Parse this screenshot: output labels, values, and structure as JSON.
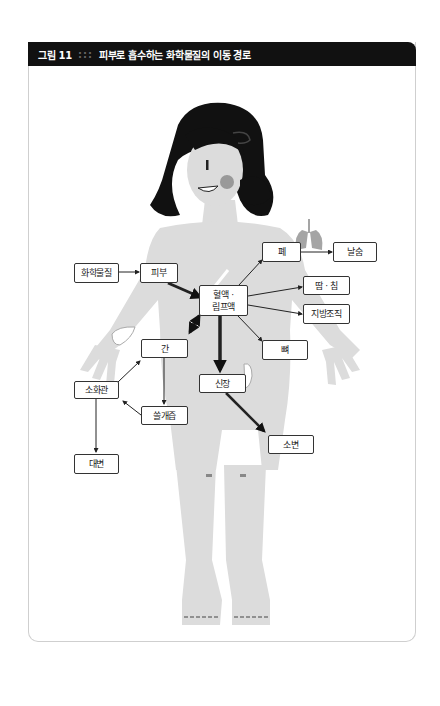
{
  "figure": {
    "number": "그림 11",
    "separator": ":::",
    "title": "피부로 흡수하는 화학물질의 이동 경로"
  },
  "nodes": {
    "chemical": "화학물질",
    "skin": "피부",
    "blood_lymph_1": "혈액 ·",
    "blood_lymph_2": "림프액",
    "lung": "폐",
    "exhale": "날숨",
    "sweat_saliva": "땀 · 침",
    "fat_tissue": "지방조직",
    "bone": "뼈",
    "liver": "간",
    "digestive_tract": "소화관",
    "bile": "쓸개즙",
    "feces": "대변",
    "kidney": "신장",
    "urine": "소변"
  },
  "edges": [
    {
      "from": "화학물질",
      "to": "피부",
      "style": "thin"
    },
    {
      "from": "피부",
      "to": "혈액 · 림프액",
      "style": "thick"
    },
    {
      "from": "혈액 · 림프액",
      "to": "폐",
      "style": "thin"
    },
    {
      "from": "폐",
      "to": "날숨",
      "style": "thin"
    },
    {
      "from": "혈액 · 림프액",
      "to": "땀 · 침",
      "style": "thin"
    },
    {
      "from": "혈액 · 림프액",
      "to": "지방조직",
      "style": "thin"
    },
    {
      "from": "혈액 · 림프액",
      "to": "뼈",
      "style": "thin"
    },
    {
      "from": "혈액 · 림프액",
      "to": "간",
      "style": "thick-bidirectional"
    },
    {
      "from": "혈액 · 림프액",
      "to": "신장",
      "style": "thick"
    },
    {
      "from": "신장",
      "to": "소변",
      "style": "thick"
    },
    {
      "from": "간",
      "to": "쓸개즙",
      "style": "thin"
    },
    {
      "from": "쓸개즙",
      "to": "소화관",
      "style": "thin"
    },
    {
      "from": "소화관",
      "to": "간",
      "style": "thin"
    },
    {
      "from": "소화관",
      "to": "대변",
      "style": "thin"
    }
  ],
  "colors": {
    "header_bg": "#111111",
    "body_fill": "#d9d9d9",
    "hair": "#111111",
    "organ": "#9a9a9a",
    "arrow": "#111111"
  }
}
